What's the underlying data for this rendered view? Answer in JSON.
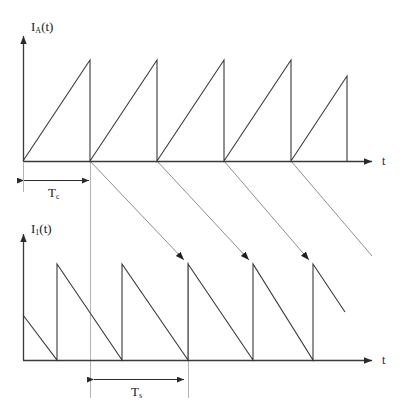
{
  "figure": {
    "type": "waveform-timing-diagram",
    "background_color": "#ffffff",
    "width": 405,
    "height": 419,
    "stroke_color": "#3a3a3a",
    "guide_color": "#b0b0b0",
    "connector_color": "#8f8f8f"
  },
  "top_plot": {
    "y_axis_label_main": "I",
    "y_axis_label_sub": "A",
    "y_axis_label_suffix": "(t)",
    "y_axis_label_full": "IA(t)",
    "x_axis_label": "t",
    "waveform_type": "rising-sawtooth",
    "dimension": {
      "label_main": "T",
      "label_sub": "c",
      "label_full": "Tc",
      "from_x": 23,
      "to_x": 90
    },
    "geometry": {
      "origin_x": 23,
      "baseline_y": 161,
      "peak_y": 60,
      "axis_top_y": 30,
      "axis_end_x": 378,
      "period": 67,
      "ramp_start_x": 23,
      "edges_x": [
        90,
        157,
        224,
        291,
        347
      ]
    }
  },
  "bottom_plot": {
    "y_axis_label_main": "I",
    "y_axis_label_sub": "1",
    "y_axis_label_suffix": "(t)",
    "y_axis_label_full": "I1(t)",
    "x_axis_label": "t",
    "waveform_type": "falling-sawtooth",
    "dimension": {
      "label_main": "T",
      "label_sub": "s",
      "label_full": "Ts",
      "from_x": 93,
      "to_x": 188
    },
    "geometry": {
      "origin_x": 23,
      "baseline_y": 360,
      "peak_y": 264,
      "axis_top_y": 228,
      "axis_end_x": 378,
      "period": 65,
      "edges_x": [
        57,
        122,
        188,
        253,
        313
      ],
      "first_partial_start_y": 315,
      "tail_end_x": 345,
      "tail_end_y": 312
    }
  },
  "connectors": {
    "description": "diagonal arrow lines from top baseline zero-crossings to bottom waveform peaks",
    "count": 4,
    "arrowheads": 3,
    "from_x": [
      90,
      157,
      224,
      291
    ],
    "to_x": [
      188,
      253,
      313,
      370
    ]
  },
  "guides": {
    "vertical_lines_x": [
      90,
      188
    ],
    "description": "light gray vertical reference lines"
  }
}
